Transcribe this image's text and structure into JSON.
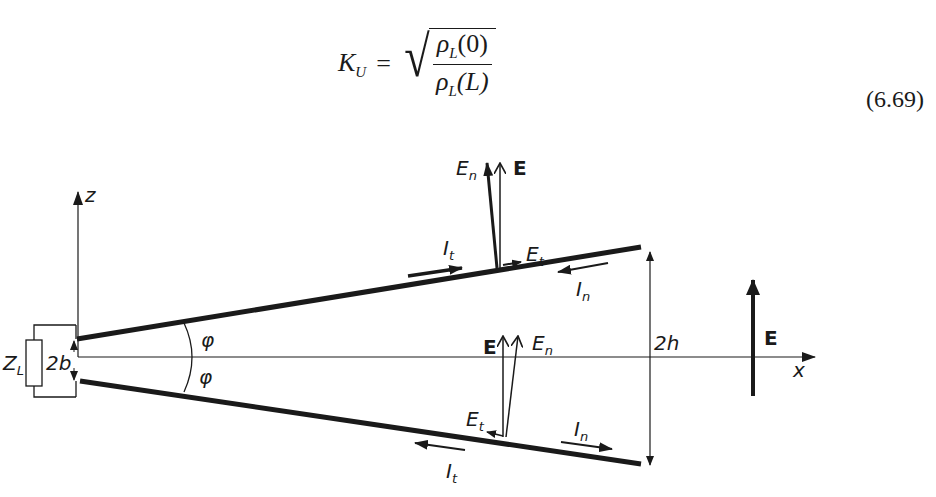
{
  "equation": {
    "lhs": "K",
    "lhs_sub": "U",
    "equals": "=",
    "numerator": "ρ",
    "numerator_sub": "L",
    "numerator_arg": "(0)",
    "denominator": "ρ",
    "denominator_sub": "L",
    "denominator_arg": "(L)",
    "number": "(6.69)"
  },
  "diagram": {
    "axis_z_label": "z",
    "axis_x_label": "x",
    "load_label": "Z",
    "load_label_sub": "L",
    "gap_label": "2b",
    "angle_label_upper": "φ",
    "angle_label_lower": "φ",
    "height_label": "2h",
    "incident_field_label": "E",
    "upper_plate": {
      "E_label": "E",
      "En_label": "E",
      "En_sub": "n",
      "Et_label": "E",
      "Et_sub": "t",
      "It_label": "I",
      "It_sub": "t",
      "In_label": "I",
      "In_sub": "n"
    },
    "lower_plate": {
      "E_label": "E",
      "En_label": "E",
      "En_sub": "n",
      "Et_label": "E",
      "Et_sub": "t",
      "It_label": "I",
      "It_sub": "t",
      "In_label": "I",
      "In_sub": "n"
    },
    "colors": {
      "ink": "#1a1a1a",
      "background": "#ffffff"
    }
  }
}
